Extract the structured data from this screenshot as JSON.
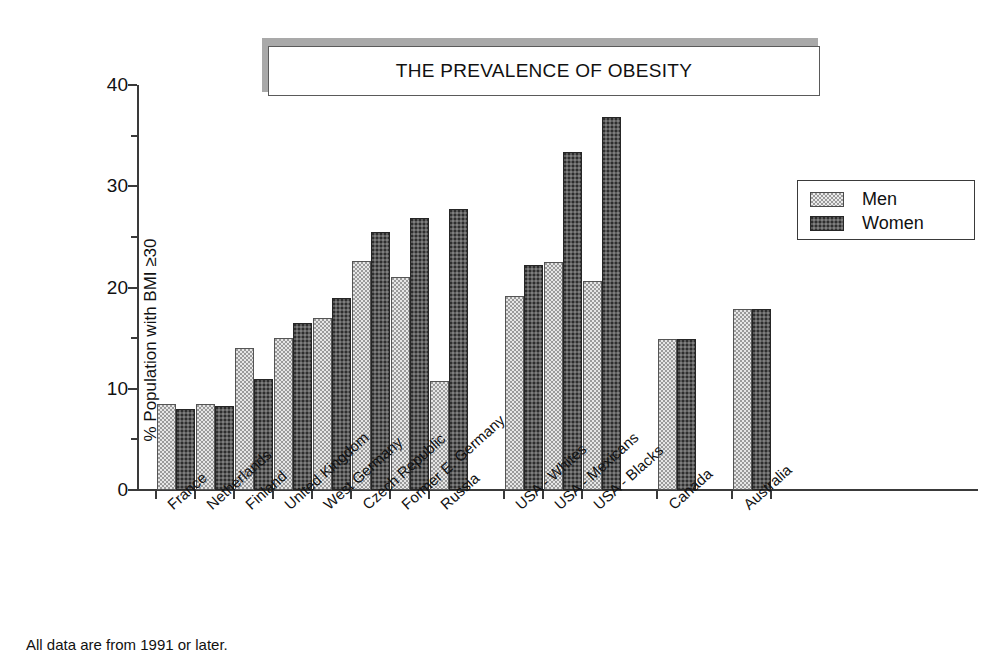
{
  "title": {
    "text": "THE PREVALENCE OF OBESITY"
  },
  "footnote": {
    "text": "All data are from 1991 or later."
  },
  "legend": {
    "items": [
      {
        "label": "Men",
        "swatch": "light-stipple"
      },
      {
        "label": "Women",
        "swatch": "dark-stipple"
      }
    ]
  },
  "axes": {
    "y_title": "% Population with BMI ≥30",
    "y_ticks": [
      "0",
      "10",
      "20",
      "30",
      "40"
    ],
    "y_minor_ticks": [
      "5",
      "15",
      "25",
      "35"
    ]
  },
  "chart_data": {
    "type": "bar",
    "title": "THE PREVALENCE OF OBESITY",
    "xlabel": "",
    "ylabel": "% Population with BMI ≥30",
    "ylim": [
      0,
      40
    ],
    "ytick_step": 10,
    "yminor_step": 5,
    "grid": false,
    "legend_position": "right-upper",
    "categories": [
      "France",
      "Netherlands",
      "Finland",
      "United Kingdom",
      "West Germany",
      "Czech Republic",
      "Former E. Germany",
      "Russia",
      "USA - Whites",
      "USA - Mexicans",
      "USA - Blacks",
      "Canada",
      "Australia"
    ],
    "group_gaps_after": [
      "Russia",
      "USA - Blacks",
      "Canada"
    ],
    "series": [
      {
        "name": "Men",
        "values": [
          8.5,
          8.5,
          14.0,
          15.0,
          17.0,
          22.6,
          21.0,
          10.8,
          19.2,
          22.5,
          20.6,
          14.9,
          17.9
        ]
      },
      {
        "name": "Women",
        "values": [
          8.0,
          8.3,
          11.0,
          16.5,
          19.0,
          25.5,
          26.9,
          27.8,
          22.2,
          33.4,
          36.8,
          14.9,
          17.9
        ]
      }
    ]
  }
}
